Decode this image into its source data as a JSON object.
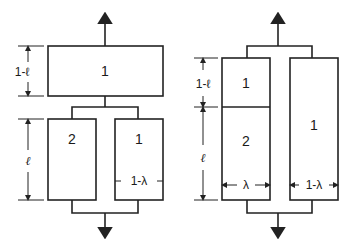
{
  "diagram": {
    "left": {
      "top_box_label": "1",
      "bottom_left_box_label": "2",
      "bottom_right_box_label": "1",
      "dim_top_label": "1-ℓ",
      "dim_bottom_label": "ℓ",
      "width_label": "1-λ"
    },
    "right": {
      "upper_left_box_label": "1",
      "lower_left_box_label": "2",
      "right_box_label": "1",
      "dim_top_label": "1-ℓ",
      "dim_bottom_label": "ℓ",
      "left_width_label": "λ",
      "right_width_label": "1-λ"
    },
    "colors": {
      "stroke": "#222222",
      "background": "#ffffff"
    }
  }
}
